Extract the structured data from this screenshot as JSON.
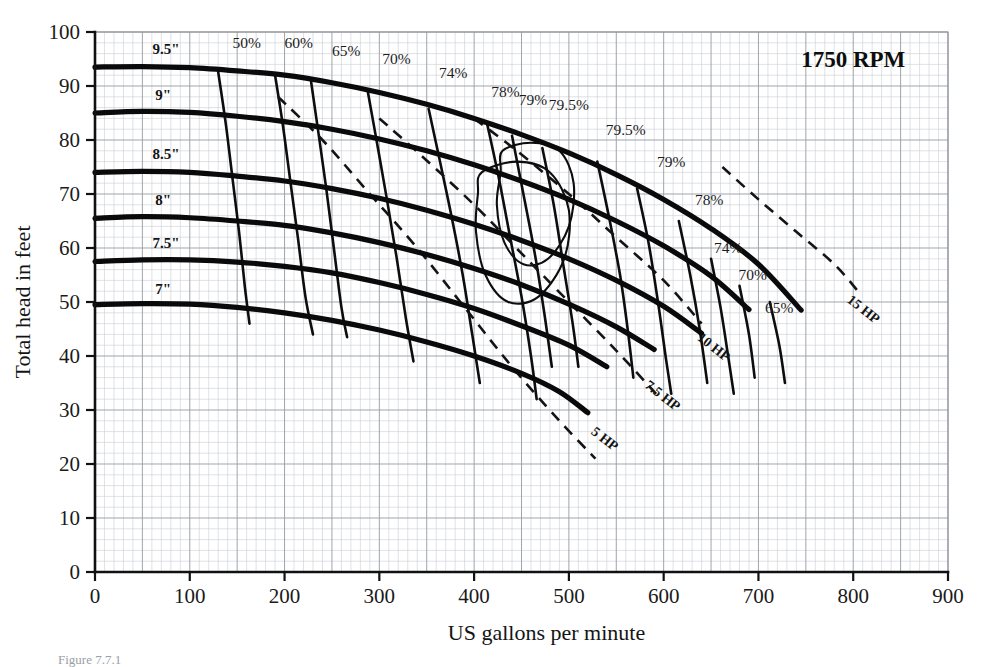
{
  "figure": {
    "title": "1750 RPM",
    "caption": "Figure 7.7.1"
  },
  "axes": {
    "x": {
      "label": "US gallons per minute",
      "min": 0,
      "max": 900,
      "ticks": [
        0,
        100,
        200,
        300,
        400,
        500,
        600,
        700,
        800,
        900
      ],
      "minor_step": 10,
      "major_step": 50
    },
    "y": {
      "label": "Total head in feet",
      "min": 0,
      "max": 100,
      "ticks": [
        0,
        10,
        20,
        30,
        40,
        50,
        60,
        70,
        80,
        90,
        100
      ],
      "minor_step": 2,
      "major_step": 10
    }
  },
  "chart_data": {
    "type": "line",
    "title": "1750 RPM",
    "xlabel": "US gallons per minute",
    "ylabel": "Total head in feet",
    "xlim": [
      0,
      900
    ],
    "ylim": [
      0,
      100
    ],
    "grid": true,
    "legend": "none",
    "series": [
      {
        "name": "9.5\"",
        "kind": "impeller-head-curve",
        "label": "9.5\"",
        "label_x": 75,
        "label_y": 96,
        "points": [
          [
            0,
            93.5
          ],
          [
            50,
            93.6
          ],
          [
            100,
            93.4
          ],
          [
            150,
            92.8
          ],
          [
            200,
            92
          ],
          [
            250,
            90.6
          ],
          [
            300,
            88.8
          ],
          [
            350,
            86.6
          ],
          [
            400,
            84
          ],
          [
            450,
            81
          ],
          [
            500,
            77.6
          ],
          [
            550,
            73.6
          ],
          [
            600,
            69
          ],
          [
            650,
            63.6
          ],
          [
            700,
            57
          ],
          [
            745,
            48.5
          ]
        ]
      },
      {
        "name": "9\"",
        "kind": "impeller-head-curve",
        "label": "9\"",
        "label_x": 72,
        "label_y": 87.5,
        "points": [
          [
            0,
            85
          ],
          [
            50,
            85.3
          ],
          [
            100,
            85.1
          ],
          [
            150,
            84.4
          ],
          [
            200,
            83.4
          ],
          [
            250,
            82
          ],
          [
            300,
            80.2
          ],
          [
            350,
            78
          ],
          [
            400,
            75.4
          ],
          [
            450,
            72.4
          ],
          [
            500,
            69
          ],
          [
            550,
            65
          ],
          [
            600,
            60.4
          ],
          [
            650,
            54.8
          ],
          [
            690,
            48.6
          ]
        ]
      },
      {
        "name": "8.5\"",
        "kind": "impeller-head-curve",
        "label": "8.5\"",
        "label_x": 75,
        "label_y": 76.5,
        "points": [
          [
            0,
            74
          ],
          [
            50,
            74.2
          ],
          [
            100,
            74
          ],
          [
            150,
            73.3
          ],
          [
            200,
            72.4
          ],
          [
            250,
            71
          ],
          [
            300,
            69.2
          ],
          [
            350,
            67
          ],
          [
            400,
            64.4
          ],
          [
            450,
            61.4
          ],
          [
            500,
            58
          ],
          [
            550,
            54
          ],
          [
            600,
            49.2
          ],
          [
            640,
            44.2
          ]
        ]
      },
      {
        "name": "8\"",
        "kind": "impeller-head-curve",
        "label": "8\"",
        "label_x": 72,
        "label_y": 68,
        "points": [
          [
            0,
            65.5
          ],
          [
            50,
            65.8
          ],
          [
            100,
            65.6
          ],
          [
            150,
            65
          ],
          [
            200,
            64.2
          ],
          [
            250,
            62.8
          ],
          [
            300,
            61
          ],
          [
            350,
            58.8
          ],
          [
            400,
            56.2
          ],
          [
            450,
            53.2
          ],
          [
            500,
            49.6
          ],
          [
            550,
            45.4
          ],
          [
            590,
            41.2
          ]
        ]
      },
      {
        "name": "7.5\"",
        "kind": "impeller-head-curve",
        "label": "7.5\"",
        "label_x": 75,
        "label_y": 60,
        "points": [
          [
            0,
            57.5
          ],
          [
            50,
            57.8
          ],
          [
            100,
            57.8
          ],
          [
            150,
            57.4
          ],
          [
            200,
            56.6
          ],
          [
            250,
            55.4
          ],
          [
            300,
            53.6
          ],
          [
            350,
            51.4
          ],
          [
            400,
            48.8
          ],
          [
            450,
            45.6
          ],
          [
            500,
            42
          ],
          [
            540,
            38
          ]
        ]
      },
      {
        "name": "7\"",
        "kind": "impeller-head-curve",
        "label": "7\"",
        "label_x": 72,
        "label_y": 51.5,
        "points": [
          [
            0,
            49.5
          ],
          [
            50,
            49.7
          ],
          [
            100,
            49.6
          ],
          [
            150,
            49
          ],
          [
            200,
            48
          ],
          [
            250,
            46.6
          ],
          [
            300,
            44.8
          ],
          [
            350,
            42.6
          ],
          [
            400,
            40
          ],
          [
            450,
            36.8
          ],
          [
            490,
            33.4
          ],
          [
            520,
            29.5
          ]
        ]
      }
    ],
    "efficiency_curves": [
      {
        "value": "50%",
        "label_top_x": 160,
        "label_top_y": 97,
        "points": [
          [
            130,
            92.6
          ],
          [
            138,
            83
          ],
          [
            145,
            73
          ],
          [
            152,
            63
          ],
          [
            158,
            53
          ],
          [
            163,
            46
          ]
        ]
      },
      {
        "value": "60%",
        "label_top_x": 215,
        "label_top_y": 97,
        "points": [
          [
            190,
            92
          ],
          [
            198,
            83
          ],
          [
            206,
            72.5
          ],
          [
            214,
            62
          ],
          [
            222,
            51
          ],
          [
            230,
            44
          ]
        ]
      },
      {
        "value": "65%",
        "label_top_x": 265,
        "label_top_y": 95.5,
        "points": [
          [
            228,
            90.8
          ],
          [
            236,
            81
          ],
          [
            244,
            71
          ],
          [
            252,
            60
          ],
          [
            260,
            49
          ],
          [
            266,
            43.5
          ]
        ]
      },
      {
        "value": "70%",
        "label_top_x": 318,
        "label_top_y": 94,
        "points": [
          [
            288,
            88.8
          ],
          [
            298,
            79
          ],
          [
            308,
            69
          ],
          [
            318,
            58.5
          ],
          [
            328,
            47
          ],
          [
            336,
            39
          ]
        ]
      },
      {
        "value": "74%",
        "label_top_x": 378,
        "label_top_y": 91.5,
        "points": [
          [
            352,
            85.8
          ],
          [
            364,
            76
          ],
          [
            376,
            66
          ],
          [
            388,
            55
          ],
          [
            398,
            44
          ],
          [
            406,
            35
          ]
        ]
      },
      {
        "value": "78%",
        "label_top_x": 433,
        "label_top_y": 88,
        "points": [
          [
            414,
            82.8
          ],
          [
            426,
            73
          ],
          [
            438,
            62
          ],
          [
            450,
            51
          ],
          [
            460,
            40
          ],
          [
            466,
            32
          ]
        ]
      },
      {
        "value": "79%",
        "label_top_x": 462,
        "label_top_y": 86.5,
        "points": [
          [
            440,
            80.8
          ],
          [
            452,
            70
          ],
          [
            464,
            59
          ],
          [
            474,
            48
          ],
          [
            482,
            38
          ]
        ]
      },
      {
        "value": "79.5%",
        "label_top_x": 500,
        "label_top_y": 85.5,
        "points": [
          [
            472,
            78.5
          ],
          [
            484,
            68
          ],
          [
            494,
            57
          ],
          [
            504,
            46
          ],
          [
            510,
            38
          ]
        ]
      },
      {
        "value": "79.5%",
        "label_right_x": 560,
        "label_right_y": 81,
        "points": [
          [
            530,
            76
          ],
          [
            542,
            66
          ],
          [
            554,
            55
          ],
          [
            562,
            45
          ],
          [
            568,
            36
          ]
        ]
      },
      {
        "value": "79%",
        "label_right_x": 608,
        "label_right_y": 75,
        "points": [
          [
            572,
            71
          ],
          [
            584,
            61
          ],
          [
            594,
            50
          ],
          [
            602,
            40
          ],
          [
            608,
            33
          ]
        ]
      },
      {
        "value": "78%",
        "label_right_x": 648,
        "label_right_y": 68,
        "points": [
          [
            616,
            65
          ],
          [
            628,
            55
          ],
          [
            638,
            45
          ],
          [
            646,
            35
          ]
        ]
      },
      {
        "value": "74%",
        "label_right_x": 668,
        "label_right_y": 59,
        "points": [
          [
            650,
            58
          ],
          [
            660,
            49
          ],
          [
            668,
            40
          ],
          [
            674,
            33
          ]
        ]
      },
      {
        "value": "70%",
        "label_right_x": 694,
        "label_right_y": 54,
        "points": [
          [
            680,
            53
          ],
          [
            690,
            44
          ],
          [
            696,
            36
          ]
        ]
      },
      {
        "value": "65%",
        "label_right_x": 722,
        "label_right_y": 48,
        "points": [
          [
            712,
            50
          ],
          [
            722,
            42
          ],
          [
            728,
            35
          ]
        ]
      }
    ],
    "efficiency_islands": [
      {
        "value": "79.5%",
        "points": [
          [
            430,
            78
          ],
          [
            460,
            79.5
          ],
          [
            490,
            78
          ],
          [
            505,
            72
          ],
          [
            500,
            64
          ],
          [
            478,
            58
          ],
          [
            452,
            57
          ],
          [
            432,
            61
          ],
          [
            424,
            68
          ],
          [
            428,
            74
          ]
        ]
      },
      {
        "value": "79%",
        "points": [
          [
            408,
            74
          ],
          [
            445,
            76
          ],
          [
            480,
            74
          ],
          [
            500,
            67
          ],
          [
            495,
            58
          ],
          [
            468,
            51
          ],
          [
            436,
            50
          ],
          [
            412,
            55
          ],
          [
            402,
            63
          ],
          [
            404,
            70
          ]
        ]
      }
    ],
    "hp_curves": [
      {
        "label": "5 HP",
        "label_x": 535,
        "label_y": 24,
        "label_rotate": 38,
        "points": [
          [
            193,
            88
          ],
          [
            240,
            80
          ],
          [
            290,
            70
          ],
          [
            340,
            60
          ],
          [
            390,
            49
          ],
          [
            440,
            38
          ],
          [
            490,
            28
          ],
          [
            528,
            21
          ]
        ]
      },
      {
        "label": "7.5 HP",
        "label_x": 596,
        "label_y": 32,
        "label_rotate": 38,
        "points": [
          [
            300,
            84
          ],
          [
            345,
            77
          ],
          [
            400,
            68
          ],
          [
            450,
            59
          ],
          [
            500,
            50
          ],
          [
            550,
            41
          ],
          [
            592,
            33
          ]
        ]
      },
      {
        "label": "10 HP",
        "label_x": 650,
        "label_y": 41,
        "label_rotate": 38,
        "points": [
          [
            400,
            84
          ],
          [
            445,
            78
          ],
          [
            500,
            70
          ],
          [
            550,
            62
          ],
          [
            600,
            54
          ],
          [
            640,
            46
          ]
        ]
      },
      {
        "label": "15 HP",
        "label_x": 808,
        "label_y": 48,
        "label_rotate": 38,
        "points": [
          [
            662,
            75
          ],
          [
            700,
            69
          ],
          [
            740,
            63
          ],
          [
            780,
            57
          ],
          [
            805,
            52
          ]
        ]
      }
    ]
  }
}
